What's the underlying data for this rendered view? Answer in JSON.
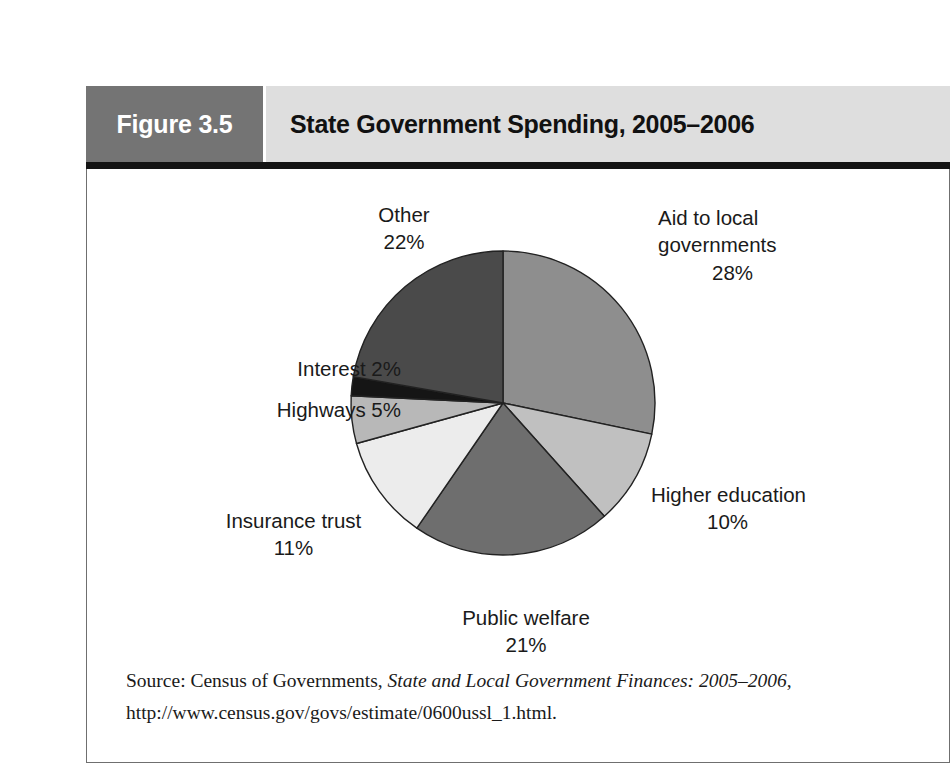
{
  "figure": {
    "number_label": "Figure 3.5",
    "title": "State Government Spending, 2005–2006"
  },
  "source": {
    "prefix": "Source: Census of Governments, ",
    "publication_italic": "State and Local Government Finances: 2005–2006",
    "suffix": ", http://",
    "url_line": "www.census.gov/govs/estimate/0600ussl_1.html."
  },
  "labels": {
    "other": {
      "name": "Other",
      "value": "22%"
    },
    "aid": {
      "name_line1": "Aid to local",
      "name_line2": "governments",
      "value": "28%"
    },
    "higher_education": {
      "name": "Higher education",
      "value": "10%"
    },
    "public_welfare": {
      "name": "Public welfare",
      "value": "21%"
    },
    "insurance_trust": {
      "name": "Insurance trust",
      "value": "11%"
    },
    "highways": {
      "name_with_value": "Highways  5%"
    },
    "interest": {
      "name_with_value": "Interest  2%"
    }
  },
  "colors": {
    "header_number_block": "#747474",
    "header_title_block": "#dedede",
    "header_underline": "#141414",
    "frame_border": "#6f6f6f",
    "slice_aid": "#8e8e8e",
    "slice_higher_education": "#c0c0c0",
    "slice_public_welfare": "#6e6e6e",
    "slice_insurance_trust": "#ececec",
    "slice_highways": "#b8b8b8",
    "slice_interest": "#151515",
    "slice_other": "#4a4a4a",
    "slice_outline": "#222222"
  },
  "chart_data": {
    "type": "pie",
    "title": "State Government Spending, 2005–2006",
    "start_angle_deg": 0,
    "direction": "clockwise",
    "total": 99,
    "units": "percent",
    "categories": [
      "Aid to local governments",
      "Higher education",
      "Public welfare",
      "Insurance trust",
      "Highways",
      "Interest",
      "Other"
    ],
    "values": [
      28,
      10,
      21,
      11,
      5,
      2,
      22
    ],
    "slices": [
      {
        "label": "Aid to local governments",
        "value": 28,
        "color": "#8e8e8e"
      },
      {
        "label": "Higher education",
        "value": 10,
        "color": "#c0c0c0"
      },
      {
        "label": "Public welfare",
        "value": 21,
        "color": "#6e6e6e"
      },
      {
        "label": "Insurance trust",
        "value": 11,
        "color": "#ececec"
      },
      {
        "label": "Highways",
        "value": 5,
        "color": "#b8b8b8"
      },
      {
        "label": "Interest",
        "value": 2,
        "color": "#151515"
      },
      {
        "label": "Other",
        "value": 22,
        "color": "#4a4a4a"
      }
    ],
    "legend": "none",
    "data_labels": true
  }
}
